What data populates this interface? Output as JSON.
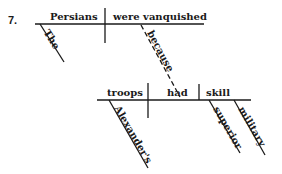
{
  "problem_number": "7.",
  "clause_main": {
    "subject": "Persians",
    "verb": "were vanquished",
    "modifiers": {
      "subject_article": "The"
    },
    "connector": "because"
  },
  "clause_sub": {
    "subject": "troops",
    "verb": "had",
    "object": "skill",
    "modifiers": {
      "subject_possessive": "Alexander's",
      "object_adj_1": "superior",
      "object_adj_2": "military"
    }
  },
  "colors": {
    "ink": "#1a1a1a",
    "background": "#ffffff"
  }
}
